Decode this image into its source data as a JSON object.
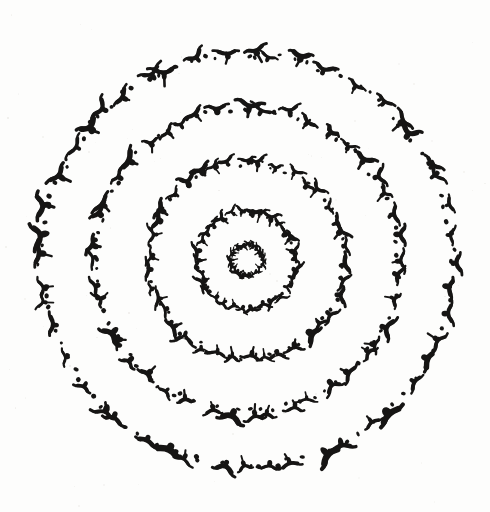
{
  "artwork": {
    "title": "Concentric Rings of Flying Birds",
    "medium": "ink on paper",
    "background_color": "#fdfdfc",
    "ink_color": "#161514",
    "canvas": {
      "width": 490,
      "height": 512
    }
  },
  "chart_data": {
    "type": "scatter",
    "subtitle": "Bird silhouette glyphs and ink dots arranged on five concentric circles",
    "xlabel": "",
    "ylabel": "",
    "xlim": [
      0,
      490
    ],
    "ylim": [
      0,
      512
    ],
    "grid": false,
    "legend": null,
    "center": {
      "x": 247,
      "y": 260
    },
    "glyph_kinds": [
      "bird",
      "dot"
    ],
    "series": [
      {
        "name": "ring-1-core",
        "radius": 15,
        "glyph_count": 22,
        "dot_count": 14,
        "bird_size": 6.0,
        "dot_size": 1.5,
        "phase_deg": 0,
        "jitter": 1.6
      },
      {
        "name": "ring-2-inner",
        "radius": 48,
        "glyph_count": 30,
        "dot_count": 34,
        "bird_size": 8.0,
        "dot_size": 1.7,
        "phase_deg": 11,
        "jitter": 2.6
      },
      {
        "name": "ring-3-middle",
        "radius": 97,
        "glyph_count": 38,
        "dot_count": 52,
        "bird_size": 9.5,
        "dot_size": 1.8,
        "phase_deg": 23,
        "jitter": 3.2
      },
      {
        "name": "ring-4-outer",
        "radius": 152,
        "glyph_count": 44,
        "dot_count": 70,
        "bird_size": 10.5,
        "dot_size": 1.9,
        "phase_deg": 7,
        "jitter": 3.6
      },
      {
        "name": "ring-5-outermost",
        "radius": 206,
        "glyph_count": 48,
        "dot_count": 86,
        "bird_size": 11.5,
        "dot_size": 2.0,
        "phase_deg": 31,
        "jitter": 4.0
      }
    ],
    "paper_specks": 70
  }
}
